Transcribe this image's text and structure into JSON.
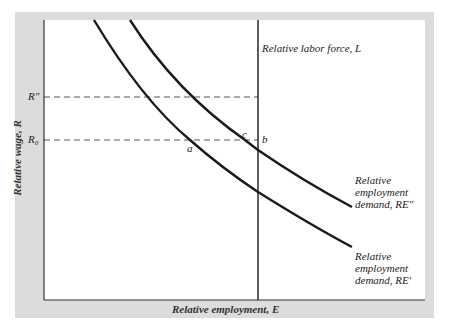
{
  "diagram": {
    "type": "economics supply-demand diagram",
    "axes": {
      "y_label": "Relative wage, R",
      "x_label": "Relative employment, E"
    },
    "y_ticks": [
      {
        "label": "R″",
        "y": 97
      },
      {
        "label": "R₀",
        "y": 140
      }
    ],
    "vertical_line": {
      "label": "Relative labor force, L",
      "x": 258
    },
    "curves": [
      {
        "id": "RE_double_prime",
        "label_line1": "Relative",
        "label_line2": "employment",
        "label_line3": "demand, RE″"
      },
      {
        "id": "RE_prime",
        "label_line1": "Relative",
        "label_line2": "employment",
        "label_line3": "demand, RE′"
      }
    ],
    "points": [
      {
        "name": "a",
        "x": 190,
        "y": 140
      },
      {
        "name": "c",
        "x": 245,
        "y": 140
      },
      {
        "name": "b",
        "x": 258,
        "y": 140
      }
    ],
    "colors": {
      "frame": "#dcdcdc",
      "line": "#1a1a1a",
      "background": "#ffffff"
    }
  }
}
